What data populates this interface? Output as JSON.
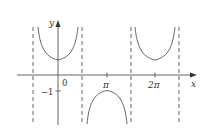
{
  "figure": {
    "type": "function-graph",
    "function": "y = sec x",
    "axes": {
      "x_label": "x",
      "y_label": "y"
    },
    "tick_labels": {
      "origin": "0",
      "neg_one": "−1",
      "pi": "π",
      "two_pi": "2π"
    },
    "asymptotes": [
      "-π/2",
      "π/2",
      "3π/2",
      "5π/2"
    ],
    "colors": {
      "curve": "#666666",
      "axis": "#555555",
      "asymptote": "#555555"
    }
  }
}
